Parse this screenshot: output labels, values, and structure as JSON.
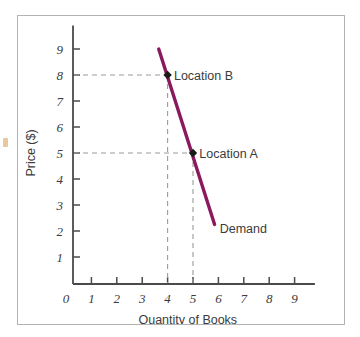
{
  "figure": {
    "frame_color": "#b3b3b3",
    "background": "#ffffff"
  },
  "chart_data": {
    "type": "line",
    "title": "",
    "subtitle": "",
    "xlabel": "Quantity of Books",
    "ylabel": "Price ($)",
    "xlim": [
      0,
      9.8
    ],
    "ylim": [
      0,
      9.6
    ],
    "xticks": [
      0,
      1,
      2,
      3,
      4,
      5,
      6,
      7,
      8,
      9
    ],
    "xtick_labels": [
      "0",
      "1",
      "2",
      "3",
      "4",
      "5",
      "6",
      "7",
      "8",
      "9"
    ],
    "yticks": [
      1,
      2,
      3,
      4,
      5,
      6,
      7,
      8,
      9
    ],
    "ytick_labels": [
      "1",
      "2",
      "3",
      "4",
      "5",
      "6",
      "7",
      "8",
      "9"
    ],
    "grid": false,
    "legend_position": "none",
    "series": [
      {
        "name": "Demand",
        "type": "line",
        "color": "#8a1a5e",
        "line_width": 3.4,
        "x": [
          3.65,
          5.85
        ],
        "y": [
          9.0,
          2.25
        ],
        "label": "Demand",
        "label_x": 6.05,
        "label_y": 2.1
      }
    ],
    "points": [
      {
        "name": "Location B",
        "label": "Location B",
        "x": 4,
        "y": 8,
        "marker": "diamond",
        "marker_color": "#1a1a1a",
        "guide_lines": "dashed",
        "guide_color": "#9b9b9b"
      },
      {
        "name": "Location A",
        "label": "Location A",
        "x": 5,
        "y": 5,
        "marker": "diamond",
        "marker_color": "#1a1a1a",
        "guide_lines": "dashed",
        "guide_color": "#9b9b9b"
      }
    ],
    "annotations": [
      {
        "text": "Location B",
        "x": 4.25,
        "y": 8.0
      },
      {
        "text": "Location A",
        "x": 5.25,
        "y": 5.0
      },
      {
        "text": "Demand",
        "x": 6.05,
        "y": 2.1
      }
    ],
    "axis_color": "#4a4a4a",
    "tick_color": "#4a4a4a"
  }
}
